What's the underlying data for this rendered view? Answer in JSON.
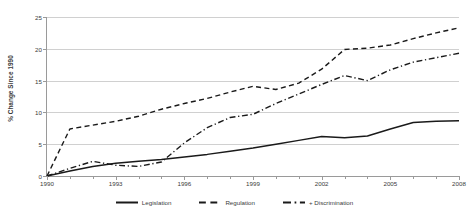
{
  "chart_data": {
    "type": "line",
    "title": "",
    "xlabel": "",
    "ylabel": "% Change Since 1990",
    "xlim": [
      1990,
      2008
    ],
    "ylim": [
      0,
      25
    ],
    "grid": true,
    "legend_position": "bottom",
    "x": [
      1990,
      1991,
      1992,
      1993,
      1994,
      1995,
      1996,
      1997,
      1998,
      1999,
      2000,
      2001,
      2002,
      2003,
      2004,
      2005,
      2006,
      2007,
      2008
    ],
    "x_tick_labels": [
      "1990",
      "1993",
      "1996",
      "1999",
      "2002",
      "2005",
      "2008"
    ],
    "x_tick_values": [
      1990,
      1993,
      1996,
      1999,
      2002,
      2005,
      2008
    ],
    "y_tick_labels": [
      "0",
      "5",
      "10",
      "15",
      "20",
      "25"
    ],
    "y_tick_values": [
      0,
      5,
      10,
      15,
      20,
      25
    ],
    "series": [
      {
        "name": "Legislation",
        "style": "solid",
        "color": "#1a1a1a",
        "values": [
          0.0,
          0.8,
          1.5,
          2.0,
          2.3,
          2.6,
          3.0,
          3.4,
          3.9,
          4.4,
          5.0,
          5.6,
          6.2,
          6.0,
          6.3,
          7.4,
          8.4,
          8.6,
          8.7
        ]
      },
      {
        "name": "Regulation",
        "style": "dashed",
        "color": "#1a1a1a",
        "values": [
          0.0,
          7.4,
          8.0,
          8.6,
          9.4,
          10.5,
          11.4,
          12.2,
          13.2,
          14.1,
          13.6,
          14.6,
          16.8,
          19.9,
          20.1,
          20.6,
          21.6,
          22.5,
          23.3
        ]
      },
      {
        "name": "+ Discrimination",
        "style": "dashdot",
        "color": "#1a1a1a",
        "values": [
          0.0,
          1.2,
          2.3,
          1.7,
          1.5,
          2.2,
          5.2,
          7.6,
          9.2,
          9.7,
          11.4,
          12.9,
          14.4,
          15.8,
          15.0,
          16.7,
          17.9,
          18.6,
          19.3
        ]
      }
    ]
  },
  "legend": {
    "items": [
      {
        "label": "Legislation",
        "swatch": "solid-line-swatch"
      },
      {
        "label": "Regulation",
        "swatch": "dashed-line-swatch"
      },
      {
        "label": "+ Discrimination",
        "swatch": "dashdot-line-swatch"
      }
    ]
  },
  "axes": {
    "y_title": "% Change Since 1990"
  }
}
